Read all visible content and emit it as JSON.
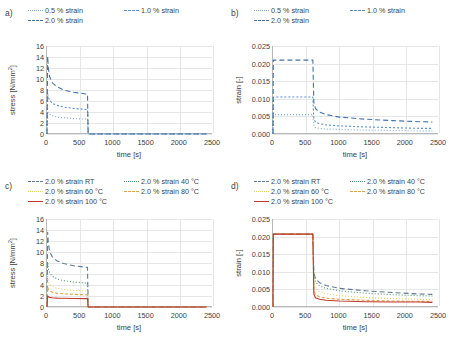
{
  "figure": {
    "width": 452,
    "height": 346,
    "background": "#ffffff"
  },
  "colors": {
    "blue_dark": "#4472a8",
    "blue_mid": "#5b8fc9",
    "blue_light": "#7fa9d6",
    "gray_blue": "#5f7a95",
    "green": "#4f9a6e",
    "yellow": "#e8d060",
    "orange": "#e8a04a",
    "red": "#c0392b",
    "axis": "#b8b8b8",
    "grid": "#e4e6e8",
    "text": "#404040"
  },
  "panels": [
    {
      "tag": "a)",
      "ylabel": "stress [N/mm²]",
      "xlabel": "time [s]",
      "legend": [
        {
          "label": "0.5 % strain",
          "color": "#7fa9d6",
          "dash": "1,2"
        },
        {
          "label": "1.0 % strain",
          "color": "#5b8fc9",
          "dash": "2,2"
        },
        {
          "label": "2.0 % strain",
          "color": "#4472a8",
          "dash": "5,3"
        }
      ],
      "yticks": [
        "0",
        "2",
        "4",
        "6",
        "8",
        "10",
        "12",
        "14",
        "16"
      ],
      "xticks": [
        "0",
        "500",
        "1000",
        "1500",
        "2000",
        "2500"
      ]
    },
    {
      "tag": "b)",
      "ylabel": "strain [-]",
      "xlabel": "time [s]",
      "legend": [
        {
          "label": "0.5 % strain",
          "color": "#7fa9d6",
          "dash": "1,2"
        },
        {
          "label": "1.0 % strain",
          "color": "#5b8fc9",
          "dash": "2,2"
        },
        {
          "label": "2.0 % strain",
          "color": "#4472a8",
          "dash": "5,3"
        }
      ],
      "yticks": [
        "0.000",
        "0.005",
        "0.010",
        "0.015",
        "0.020",
        "0.025"
      ],
      "xticks": [
        "0",
        "500",
        "1000",
        "1500",
        "2000",
        "2500"
      ]
    },
    {
      "tag": "c)",
      "ylabel": "stress [N/mm²]",
      "xlabel": "time [s]",
      "legend": [
        {
          "label": "2.0 % strain RT",
          "color": "#5f7a95",
          "dash": "5,3"
        },
        {
          "label": "2.0 % strain 40 °C",
          "color": "#4f9a6e",
          "dash": "1,2"
        },
        {
          "label": "2.0 % strain 60 °C",
          "color": "#e8d060",
          "dash": "1,2"
        },
        {
          "label": "2.0 % strain 80 °C",
          "color": "#e8a04a",
          "dash": "3,2"
        },
        {
          "label": "2.0 % strain 100 °C",
          "color": "#c0392b",
          "dash": "none"
        }
      ],
      "yticks": [
        "0",
        "2",
        "4",
        "6",
        "8",
        "10",
        "12",
        "14",
        "16"
      ],
      "xticks": [
        "0",
        "500",
        "1000",
        "1500",
        "2000",
        "2500"
      ]
    },
    {
      "tag": "d)",
      "ylabel": "strain [-]",
      "xlabel": "time [s]",
      "legend": [
        {
          "label": "2.0 % strain RT",
          "color": "#5f7a95",
          "dash": "5,3"
        },
        {
          "label": "2.0 % strain 40 °C",
          "color": "#4f9a6e",
          "dash": "1,2"
        },
        {
          "label": "2.0 % strain 60 °C",
          "color": "#e8d060",
          "dash": "1,2"
        },
        {
          "label": "2.0 % strain 80 °C",
          "color": "#e8a04a",
          "dash": "3,2"
        },
        {
          "label": "2.0 % strain 100 °C",
          "color": "#c0392b",
          "dash": "none"
        }
      ],
      "yticks": [
        "0.000",
        "0.005",
        "0.010",
        "0.015",
        "0.020",
        "0.025"
      ],
      "xticks": [
        "0",
        "500",
        "1000",
        "1500",
        "2000",
        "2500"
      ]
    }
  ],
  "chart_data": [
    {
      "type": "line",
      "panel": "a",
      "title": "",
      "xlabel": "time [s]",
      "ylabel": "stress [N/mm²]",
      "xlim": [
        0,
        2500
      ],
      "ylim": [
        0,
        16
      ],
      "xticks": [
        0,
        500,
        1000,
        1500,
        2000,
        2500
      ],
      "yticks": [
        0,
        2,
        4,
        6,
        8,
        10,
        12,
        14,
        16
      ],
      "grid": true,
      "legend_position": "above",
      "series": [
        {
          "name": "0.5 % strain",
          "color": "#7fa9d6",
          "dash": "1,2",
          "x": [
            0,
            10,
            20,
            40,
            80,
            150,
            250,
            400,
            600,
            610,
            620,
            1000,
            1500,
            2000,
            2400
          ],
          "y": [
            0,
            4.2,
            3.9,
            3.6,
            3.35,
            3.1,
            2.95,
            2.8,
            2.7,
            2.7,
            0,
            0,
            0,
            0,
            0
          ]
        },
        {
          "name": "1.0 % strain",
          "color": "#5b8fc9",
          "dash": "2,2",
          "x": [
            0,
            10,
            20,
            40,
            80,
            150,
            250,
            400,
            600,
            610,
            620,
            1000,
            1500,
            2000,
            2400
          ],
          "y": [
            0,
            7.3,
            6.7,
            6.1,
            5.6,
            5.2,
            4.9,
            4.65,
            4.45,
            4.45,
            0,
            0,
            0,
            0,
            0
          ]
        },
        {
          "name": "2.0 % strain",
          "color": "#4472a8",
          "dash": "5,3",
          "x": [
            0,
            10,
            20,
            40,
            80,
            150,
            250,
            400,
            600,
            610,
            620,
            1000,
            1500,
            2000,
            2400
          ],
          "y": [
            0,
            14.1,
            12.0,
            10.4,
            9.3,
            8.6,
            8.0,
            7.6,
            7.25,
            7.25,
            0,
            0,
            0,
            0,
            0
          ]
        }
      ]
    },
    {
      "type": "line",
      "panel": "b",
      "title": "",
      "xlabel": "time [s]",
      "ylabel": "strain [-]",
      "xlim": [
        0,
        2500
      ],
      "ylim": [
        0,
        0.025
      ],
      "xticks": [
        0,
        500,
        1000,
        1500,
        2000,
        2500
      ],
      "yticks": [
        0.0,
        0.005,
        0.01,
        0.015,
        0.02,
        0.025
      ],
      "grid": true,
      "legend_position": "above",
      "series": [
        {
          "name": "0.5 % strain",
          "color": "#7fa9d6",
          "dash": "1,2",
          "x": [
            0,
            5,
            300,
            600,
            615,
            640,
            700,
            800,
            1000,
            1400,
            1800,
            2200,
            2400
          ],
          "y": [
            0,
            0.0055,
            0.0055,
            0.0055,
            0.0022,
            0.0018,
            0.0016,
            0.0014,
            0.0013,
            0.0011,
            0.001,
            0.0009,
            0.0009
          ]
        },
        {
          "name": "1.0 % strain",
          "color": "#5b8fc9",
          "dash": "2,2",
          "x": [
            0,
            5,
            300,
            600,
            615,
            640,
            700,
            800,
            1000,
            1400,
            1800,
            2200,
            2400
          ],
          "y": [
            0,
            0.0105,
            0.0105,
            0.0105,
            0.0042,
            0.0034,
            0.0029,
            0.0026,
            0.0023,
            0.002,
            0.0018,
            0.0016,
            0.0016
          ]
        },
        {
          "name": "2.0 % strain",
          "color": "#4472a8",
          "dash": "5,3",
          "x": [
            0,
            5,
            300,
            600,
            615,
            640,
            700,
            800,
            1000,
            1400,
            1800,
            2200,
            2400
          ],
          "y": [
            0,
            0.021,
            0.021,
            0.021,
            0.009,
            0.0072,
            0.0062,
            0.0055,
            0.0048,
            0.0042,
            0.0038,
            0.0035,
            0.0034
          ]
        }
      ]
    },
    {
      "type": "line",
      "panel": "c",
      "title": "",
      "xlabel": "time [s]",
      "ylabel": "stress [N/mm²]",
      "xlim": [
        0,
        2500
      ],
      "ylim": [
        0,
        16
      ],
      "xticks": [
        0,
        500,
        1000,
        1500,
        2000,
        2500
      ],
      "yticks": [
        0,
        2,
        4,
        6,
        8,
        10,
        12,
        14,
        16
      ],
      "grid": true,
      "legend_position": "above",
      "series": [
        {
          "name": "2.0 % strain RT",
          "color": "#5f7a95",
          "dash": "5,3",
          "x": [
            0,
            10,
            20,
            40,
            80,
            150,
            250,
            400,
            600,
            610,
            620,
            1200,
            1800,
            2400
          ],
          "y": [
            0,
            13.6,
            11.6,
            10.1,
            9.1,
            8.4,
            7.9,
            7.5,
            7.2,
            7.2,
            0,
            0,
            0,
            0
          ]
        },
        {
          "name": "2.0 % strain 40 °C",
          "color": "#4f9a6e",
          "dash": "1,2",
          "x": [
            0,
            10,
            20,
            40,
            80,
            150,
            250,
            400,
            600,
            610,
            620,
            1200,
            1800,
            2400
          ],
          "y": [
            0,
            8.1,
            7.0,
            6.2,
            5.6,
            5.1,
            4.8,
            4.55,
            4.35,
            4.35,
            0,
            0,
            0,
            0
          ]
        },
        {
          "name": "2.0 % strain 60 °C",
          "color": "#e8d060",
          "dash": "1,2",
          "x": [
            0,
            10,
            20,
            40,
            80,
            150,
            250,
            400,
            600,
            610,
            620,
            1200,
            1800,
            2400
          ],
          "y": [
            0,
            5.5,
            4.7,
            4.1,
            3.7,
            3.4,
            3.2,
            3.0,
            2.9,
            2.9,
            0,
            0,
            0,
            0
          ]
        },
        {
          "name": "2.0 % strain 80 °C",
          "color": "#e8a04a",
          "dash": "3,2",
          "x": [
            0,
            10,
            20,
            40,
            80,
            150,
            250,
            400,
            600,
            610,
            620,
            1200,
            1800,
            2400
          ],
          "y": [
            0,
            3.6,
            3.2,
            2.9,
            2.7,
            2.5,
            2.4,
            2.3,
            2.2,
            2.2,
            0,
            0,
            0,
            0
          ]
        },
        {
          "name": "2.0 % strain 100 °C",
          "color": "#c0392b",
          "dash": "none",
          "x": [
            0,
            10,
            20,
            40,
            80,
            150,
            250,
            400,
            600,
            610,
            620,
            1200,
            1800,
            2400
          ],
          "y": [
            0,
            2.0,
            1.85,
            1.75,
            1.68,
            1.62,
            1.58,
            1.55,
            1.52,
            1.52,
            0,
            0,
            0,
            0
          ]
        }
      ]
    },
    {
      "type": "line",
      "panel": "d",
      "title": "",
      "xlabel": "time [s]",
      "ylabel": "strain [-]",
      "xlim": [
        0,
        2500
      ],
      "ylim": [
        0,
        0.025
      ],
      "xticks": [
        0,
        500,
        1000,
        1500,
        2000,
        2500
      ],
      "yticks": [
        0.0,
        0.005,
        0.01,
        0.015,
        0.02,
        0.025
      ],
      "grid": true,
      "legend_position": "above",
      "series": [
        {
          "name": "2.0 % strain RT",
          "color": "#5f7a95",
          "dash": "5,3",
          "x": [
            0,
            5,
            300,
            600,
            615,
            640,
            700,
            800,
            1000,
            1400,
            1800,
            2200,
            2400
          ],
          "y": [
            0,
            0.0207,
            0.0207,
            0.0207,
            0.0098,
            0.008,
            0.0069,
            0.0061,
            0.0053,
            0.0046,
            0.0041,
            0.0037,
            0.0036
          ]
        },
        {
          "name": "2.0 % strain 40 °C",
          "color": "#4f9a6e",
          "dash": "1,2",
          "x": [
            0,
            5,
            300,
            600,
            615,
            640,
            700,
            800,
            1000,
            1400,
            1800,
            2200,
            2400
          ],
          "y": [
            0,
            0.0207,
            0.0207,
            0.0207,
            0.009,
            0.0071,
            0.006,
            0.0053,
            0.0046,
            0.0039,
            0.0035,
            0.0032,
            0.0031
          ]
        },
        {
          "name": "2.0 % strain 60 °C",
          "color": "#e8d060",
          "dash": "1,2",
          "x": [
            0,
            5,
            300,
            600,
            615,
            640,
            700,
            800,
            1000,
            1400,
            1800,
            2200,
            2400
          ],
          "y": [
            0,
            0.0207,
            0.0207,
            0.0207,
            0.007,
            0.0053,
            0.0044,
            0.0038,
            0.0032,
            0.0027,
            0.0024,
            0.0022,
            0.0021
          ]
        },
        {
          "name": "2.0 % strain 80 °C",
          "color": "#e8a04a",
          "dash": "3,2",
          "x": [
            0,
            5,
            300,
            600,
            615,
            640,
            700,
            800,
            1000,
            1400,
            1800,
            2200,
            2400
          ],
          "y": [
            0,
            0.0207,
            0.0207,
            0.0207,
            0.0048,
            0.0035,
            0.0029,
            0.0025,
            0.0022,
            0.0019,
            0.0017,
            0.0016,
            0.0016
          ]
        },
        {
          "name": "2.0 % strain 100 °C",
          "color": "#c0392b",
          "dash": "none",
          "x": [
            0,
            5,
            300,
            600,
            615,
            640,
            700,
            800,
            1000,
            1400,
            1800,
            2200,
            2400
          ],
          "y": [
            0,
            0.0207,
            0.0207,
            0.0207,
            0.0036,
            0.0026,
            0.0022,
            0.0019,
            0.0017,
            0.0015,
            0.0014,
            0.0014,
            0.0013
          ]
        }
      ]
    }
  ]
}
